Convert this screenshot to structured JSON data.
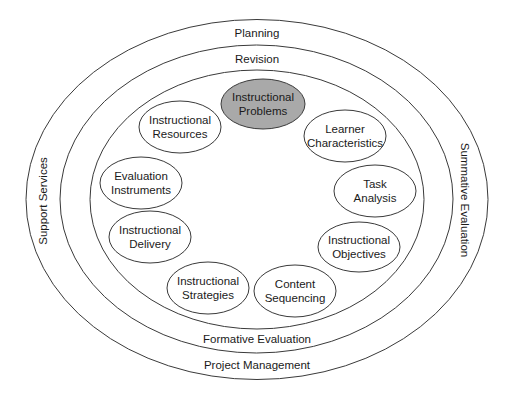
{
  "rings": [
    {
      "id": "outer",
      "cx": 257,
      "cy": 199.5,
      "rx": 231,
      "ry": 180,
      "labels": {
        "top": "Planning",
        "bottom": "Project Management",
        "left": "Support Services"
      }
    },
    {
      "id": "middle",
      "cx": 256.5,
      "cy": 199,
      "rx": 196.5,
      "ry": 154,
      "labels": {
        "top": "Revision",
        "bottom": "Formative Evaluation",
        "right": "Summative Evaluation"
      }
    },
    {
      "id": "inner",
      "cx": 257,
      "cy": 199.5,
      "rx": 167,
      "ry": 129.5
    }
  ],
  "nodes": [
    {
      "id": "instructional-problems",
      "lines": [
        "Instructional",
        "Problems"
      ],
      "cx": 263,
      "cy": 104,
      "rx": 42,
      "ry": 25,
      "highlighted": true
    },
    {
      "id": "learner-characteristics",
      "lines": [
        "Learner",
        "Characteristics"
      ],
      "cx": 345,
      "cy": 136,
      "rx": 41,
      "ry": 26,
      "highlighted": false
    },
    {
      "id": "task-analysis",
      "lines": [
        "Task",
        "Analysis"
      ],
      "cx": 375,
      "cy": 191,
      "rx": 41,
      "ry": 26,
      "highlighted": false
    },
    {
      "id": "instructional-objectives",
      "lines": [
        "Instructional",
        "Objectives"
      ],
      "cx": 359,
      "cy": 247,
      "rx": 41,
      "ry": 25,
      "highlighted": false
    },
    {
      "id": "content-sequencing",
      "lines": [
        "Content",
        "Sequencing"
      ],
      "cx": 295,
      "cy": 291,
      "rx": 41,
      "ry": 26,
      "highlighted": false
    },
    {
      "id": "instructional-strategies",
      "lines": [
        "Instructional",
        "Strategies"
      ],
      "cx": 208,
      "cy": 288,
      "rx": 41,
      "ry": 26,
      "highlighted": false
    },
    {
      "id": "instructional-delivery",
      "lines": [
        "Instructional",
        "Delivery"
      ],
      "cx": 150,
      "cy": 237,
      "rx": 41,
      "ry": 26,
      "highlighted": false
    },
    {
      "id": "evaluation-instruments",
      "lines": [
        "Evaluation",
        "Instruments"
      ],
      "cx": 141,
      "cy": 183,
      "rx": 41,
      "ry": 26,
      "highlighted": false
    },
    {
      "id": "instructional-resources",
      "lines": [
        "Instructional",
        "Resources"
      ],
      "cx": 180,
      "cy": 127,
      "rx": 41,
      "ry": 26,
      "highlighted": false
    }
  ],
  "colors": {
    "stroke": "#3a3a3a",
    "highlight_fill": "#a9a9a9",
    "background": "#ffffff"
  }
}
